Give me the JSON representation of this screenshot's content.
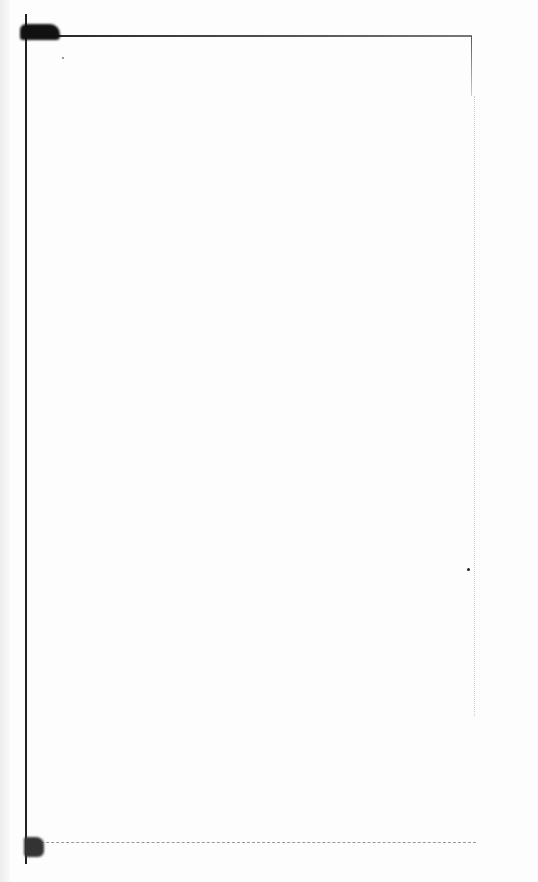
{
  "page": {
    "type": "scanned-blank-page",
    "background_color": "#fdfdfd",
    "frame_color": "#222222"
  }
}
